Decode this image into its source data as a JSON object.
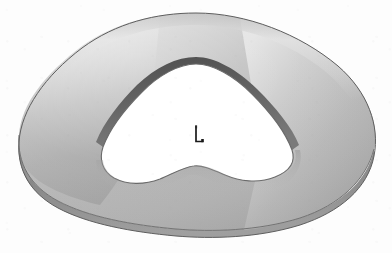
{
  "canvas": {
    "width": 392,
    "height": 253,
    "background_color": "#fdfdfd"
  },
  "scene": {
    "title": "Shaded 3D solid render",
    "object_name": "annular-extruded-solid",
    "description": "Grayscale shaded CAD render of a ring-shaped extruded solid with a rounded pentagonal outer profile and a wavy star-shaped inner hole",
    "render_style": "smooth-shaded-grayscale",
    "projection": "perspective"
  },
  "colors": {
    "background": "#fdfdfd",
    "top_face_light": "#e3e3e3",
    "top_face_mid": "#bdbdbd",
    "top_face_dark": "#9a9a9a",
    "highlight": "#f2f2f2",
    "side_wall_dark": "#6f6f6f",
    "side_wall_mid": "#8c8c8c",
    "inner_wall_dark": "#5a5a5a",
    "outline": "#4a4a4a",
    "hole_fill": "#ffffff",
    "marker": "#1a1a1a"
  },
  "marker": {
    "name": "coordinate-axis-marker",
    "label": "L",
    "x": 197,
    "y": 136,
    "color": "#1a1a1a"
  },
  "geometry": {
    "outer_profile_label": "rounded pentagonal outline",
    "inner_profile_label": "wavy star-shaped hole",
    "extrusion_visible_edge": "bottom-left",
    "outer_bounds": {
      "left": 18,
      "top": 13,
      "right": 376,
      "bottom": 238
    },
    "inner_bounds": {
      "left": 100,
      "top": 62,
      "right": 296,
      "bottom": 198
    }
  }
}
